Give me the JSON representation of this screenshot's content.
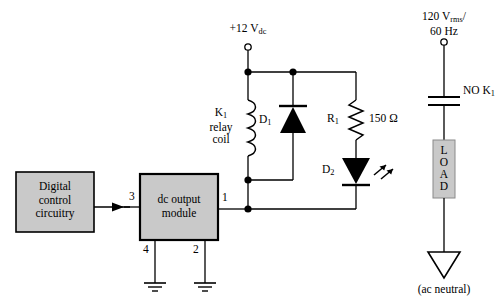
{
  "diagram": {
    "colors": {
      "line": "#000000",
      "box_fill": "#c9c9c9",
      "box_border": "#000000",
      "background": "#ffffff"
    }
  },
  "blocks": {
    "digital_control": {
      "line1": "Digital",
      "line2": "control",
      "line3": "circuitry"
    },
    "dc_output_module": {
      "line1": "dc output",
      "line2": "module"
    },
    "load": {
      "letters": [
        "L",
        "O",
        "A",
        "D"
      ]
    }
  },
  "terminals": {
    "t3": "3",
    "t1": "1",
    "t4": "4",
    "t2": "2"
  },
  "supplies": {
    "dc_value": "+12 V",
    "dc_sub": "dc",
    "ac_value": "120 V",
    "ac_sub": "rms",
    "ac_slash": "/",
    "ac_freq": "60 Hz",
    "ac_neutral": "(ac neutral)"
  },
  "components": {
    "relay_coil": {
      "ref": "K",
      "ref_sub": "1",
      "line2": "relay",
      "line3": "coil"
    },
    "diode_d1": {
      "ref": "D",
      "ref_sub": "1"
    },
    "resistor_r1": {
      "ref": "R",
      "ref_sub": "1",
      "value": "150 Ω"
    },
    "led_d2": {
      "ref": "D",
      "ref_sub": "2"
    },
    "contact_k1": {
      "label": "NO K",
      "label_sub": "1"
    }
  }
}
